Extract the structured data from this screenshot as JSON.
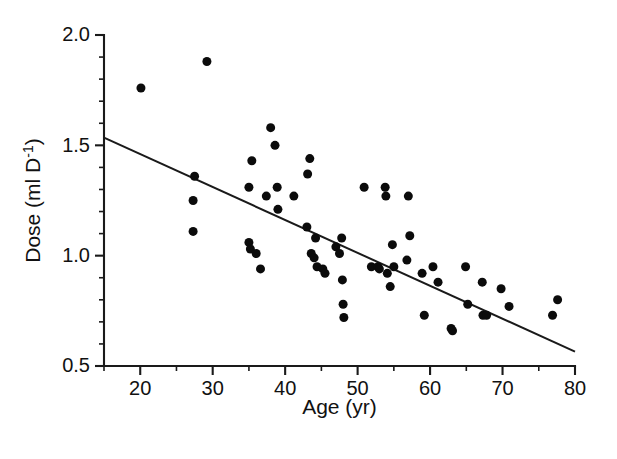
{
  "chart_data": {
    "type": "scatter",
    "title": "",
    "xlabel": "Age (yr)",
    "ylabel": "Dose (ml D",
    "ylabel_sup": "-1",
    "ylabel_tail": ")",
    "xlim": [
      15,
      80
    ],
    "ylim": [
      0.5,
      2.0
    ],
    "grid": false,
    "legend": "none",
    "xticks": [
      20,
      30,
      40,
      50,
      60,
      70,
      80
    ],
    "xtick_labels": [
      "20",
      "30",
      "40",
      "50",
      "60",
      "70",
      "80"
    ],
    "xticks_minor": [
      15,
      25,
      35,
      45,
      55,
      65,
      75
    ],
    "yticks": [
      0.5,
      1.0,
      1.5,
      2.0
    ],
    "ytick_labels": [
      "0.5",
      "1.0",
      "1.5",
      "2.0"
    ],
    "yticks_minor": [
      0.6,
      0.7,
      0.8,
      0.9,
      1.1,
      1.2,
      1.3,
      1.4,
      1.6,
      1.7,
      1.8,
      1.9
    ],
    "marker": "filled-circle",
    "marker_color": "#0b0b0b",
    "marker_size_px": 9,
    "points": [
      {
        "x": 20.1,
        "y": 1.76
      },
      {
        "x": 29.2,
        "y": 1.88
      },
      {
        "x": 27.5,
        "y": 1.36
      },
      {
        "x": 27.3,
        "y": 1.25
      },
      {
        "x": 27.3,
        "y": 1.11
      },
      {
        "x": 35.0,
        "y": 1.31
      },
      {
        "x": 35.0,
        "y": 1.06
      },
      {
        "x": 35.2,
        "y": 1.03
      },
      {
        "x": 35.4,
        "y": 1.43
      },
      {
        "x": 36.0,
        "y": 1.01
      },
      {
        "x": 36.6,
        "y": 0.94
      },
      {
        "x": 37.4,
        "y": 1.27
      },
      {
        "x": 38.0,
        "y": 1.58
      },
      {
        "x": 38.6,
        "y": 1.5
      },
      {
        "x": 38.9,
        "y": 1.31
      },
      {
        "x": 39.0,
        "y": 1.21
      },
      {
        "x": 41.2,
        "y": 1.27
      },
      {
        "x": 43.0,
        "y": 1.13
      },
      {
        "x": 43.1,
        "y": 1.37
      },
      {
        "x": 43.4,
        "y": 1.44
      },
      {
        "x": 43.6,
        "y": 1.01
      },
      {
        "x": 44.0,
        "y": 0.99
      },
      {
        "x": 44.2,
        "y": 1.08
      },
      {
        "x": 44.4,
        "y": 0.95
      },
      {
        "x": 45.2,
        "y": 0.94
      },
      {
        "x": 45.5,
        "y": 0.92
      },
      {
        "x": 47.0,
        "y": 1.04
      },
      {
        "x": 47.5,
        "y": 1.01
      },
      {
        "x": 47.8,
        "y": 1.08
      },
      {
        "x": 47.9,
        "y": 0.89
      },
      {
        "x": 48.0,
        "y": 0.78
      },
      {
        "x": 48.1,
        "y": 0.72
      },
      {
        "x": 50.9,
        "y": 1.31
      },
      {
        "x": 51.9,
        "y": 0.95
      },
      {
        "x": 52.8,
        "y": 0.95
      },
      {
        "x": 53.0,
        "y": 0.94
      },
      {
        "x": 53.8,
        "y": 1.31
      },
      {
        "x": 53.9,
        "y": 1.27
      },
      {
        "x": 54.1,
        "y": 0.92
      },
      {
        "x": 54.5,
        "y": 0.86
      },
      {
        "x": 54.8,
        "y": 1.05
      },
      {
        "x": 55.0,
        "y": 0.95
      },
      {
        "x": 56.8,
        "y": 0.98
      },
      {
        "x": 57.0,
        "y": 1.27
      },
      {
        "x": 57.2,
        "y": 1.09
      },
      {
        "x": 58.9,
        "y": 0.92
      },
      {
        "x": 59.2,
        "y": 0.73
      },
      {
        "x": 60.4,
        "y": 0.95
      },
      {
        "x": 61.1,
        "y": 0.88
      },
      {
        "x": 62.9,
        "y": 0.67
      },
      {
        "x": 63.1,
        "y": 0.66
      },
      {
        "x": 64.9,
        "y": 0.95
      },
      {
        "x": 65.2,
        "y": 0.78
      },
      {
        "x": 67.2,
        "y": 0.88
      },
      {
        "x": 67.3,
        "y": 0.73
      },
      {
        "x": 67.8,
        "y": 0.73
      },
      {
        "x": 69.8,
        "y": 0.85
      },
      {
        "x": 70.9,
        "y": 0.77
      },
      {
        "x": 76.9,
        "y": 0.73
      },
      {
        "x": 77.6,
        "y": 0.8
      }
    ],
    "fit_line": {
      "x_start": 15,
      "y_start": 1.535,
      "x_end": 80,
      "y_end": 0.565,
      "color": "#1a1a1a"
    }
  }
}
